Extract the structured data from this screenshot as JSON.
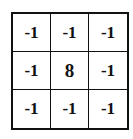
{
  "kernel": {
    "rows": 3,
    "cols": 3,
    "cells": [
      [
        "-1",
        "-1",
        "-1"
      ],
      [
        "-1",
        "8",
        "-1"
      ],
      [
        "-1",
        "-1",
        "-1"
      ]
    ],
    "colors": {
      "border": "#111111",
      "background": "#ffffff",
      "text": "#111111"
    }
  }
}
